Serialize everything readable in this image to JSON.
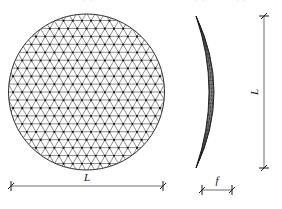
{
  "figure": {
    "caption_top": "空间网格结构 · 球面网壳几何参数示意（平面图与立面图）",
    "views": {
      "plan": {
        "name": "plan-view",
        "shape": "circle",
        "mesh_type": "triangulated-lamella-grid",
        "center": [
          86.5,
          92
        ],
        "radius": 78
      },
      "elevation": {
        "name": "elevation-view",
        "shape": "spherical-cap-profile",
        "mesh_type": "triangulated-lamella-grid",
        "top": [
          196,
          16
        ],
        "bottom": [
          196,
          168
        ],
        "crown": [
          230,
          92
        ]
      }
    },
    "dimensions": [
      {
        "id": "span-plan",
        "label": "L",
        "orientation": "horizontal",
        "x1": 11,
        "x2": 163,
        "y": 186,
        "label_x": 87,
        "label_y": 181
      },
      {
        "id": "span-elevation",
        "label": "L",
        "orientation": "vertical",
        "x": 264,
        "y1": 16,
        "y2": 168,
        "label_x": 258,
        "label_y": 92
      },
      {
        "id": "rise",
        "label": "f",
        "orientation": "horizontal",
        "x1": 202,
        "x2": 232,
        "y": 190,
        "label_x": 217,
        "label_y": 184
      }
    ],
    "colors": {
      "background": "#ffffff",
      "mesh_line": "#303030",
      "mesh_node": "#101010",
      "outline": "#1a1a1a",
      "dimension_line": "#6e6e6e",
      "dimension_tick": "#1a1a1a",
      "label_text": "#111111"
    }
  }
}
